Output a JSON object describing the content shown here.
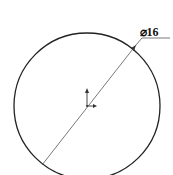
{
  "drawing": {
    "type": "sketch",
    "circle": {
      "cx": 87,
      "cy": 106,
      "r": 73,
      "stroke": "#222222"
    },
    "dimension": {
      "symbol": "⌀",
      "value": "16",
      "label": "⌀16",
      "leader_color": "#555555"
    },
    "origin_marker": {
      "x": 87,
      "y": 106
    }
  }
}
